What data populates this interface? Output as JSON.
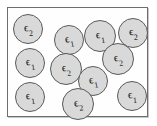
{
  "figure": {
    "title": "",
    "symbol": "ϵ",
    "colors": {
      "page_background": "#ffffff",
      "box_background": "#fefefe",
      "box_border": "#6d6d6d",
      "box_shadow": "#c9c9c9",
      "circle_fill": "#d9d9d9",
      "circle_border": "#5a5a5a",
      "label_color": "#111111"
    },
    "box": {
      "left": 7,
      "top": 7,
      "width": 141,
      "height": 110
    },
    "counts": {
      "total": 12,
      "epsilon_1": 7,
      "epsilon_2": 5
    },
    "particles": [
      {
        "id": "p1",
        "label_symbol": "ϵ",
        "label_sub": "2",
        "cx": 27,
        "cy": 28,
        "r": 15,
        "rot": -6
      },
      {
        "id": "p2",
        "label_symbol": "ϵ",
        "label_sub": "1",
        "cx": 68,
        "cy": 39,
        "r": 15,
        "rot": -10
      },
      {
        "id": "p3",
        "label_symbol": "ϵ",
        "label_sub": "1",
        "cx": 99,
        "cy": 35,
        "r": 16,
        "rot": -8
      },
      {
        "id": "p4",
        "label_symbol": "ϵ",
        "label_sub": "2",
        "cx": 132,
        "cy": 32,
        "r": 15,
        "rot": -4
      },
      {
        "id": "p5",
        "label_symbol": "ϵ",
        "label_sub": "1",
        "cx": 29,
        "cy": 62,
        "r": 15,
        "rot": -8
      },
      {
        "id": "p6",
        "label_symbol": "ϵ",
        "label_sub": "2",
        "cx": 65,
        "cy": 68,
        "r": 16,
        "rot": -8
      },
      {
        "id": "p7",
        "label_symbol": "ϵ",
        "label_sub": "2",
        "cx": 117,
        "cy": 58,
        "r": 16,
        "rot": -8
      },
      {
        "id": "p8",
        "label_symbol": "ϵ",
        "label_sub": "1",
        "cx": 92,
        "cy": 80,
        "r": 15,
        "rot": -10
      },
      {
        "id": "p9",
        "label_symbol": "ϵ",
        "label_sub": "1",
        "cx": 29,
        "cy": 96,
        "r": 15,
        "rot": -8
      },
      {
        "id": "p10",
        "label_symbol": "ϵ",
        "label_sub": "2",
        "cx": 77,
        "cy": 103,
        "r": 16,
        "rot": -10
      },
      {
        "id": "p11",
        "label_symbol": "ϵ",
        "label_sub": "1",
        "cx": 131,
        "cy": 95,
        "r": 15,
        "rot": -6
      },
      {
        "id": "p12",
        "label_symbol": "ϵ",
        "label_sub": "1",
        "cx": 100,
        "cy": 13,
        "r": 0,
        "rot": 0,
        "hidden": true
      }
    ]
  }
}
